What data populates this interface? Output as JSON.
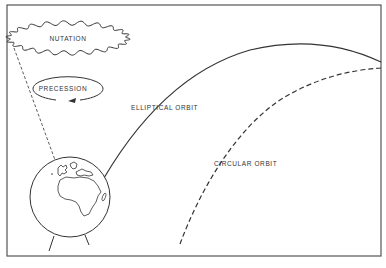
{
  "diagram": {
    "labels": {
      "nutation": "NUTATION",
      "precession": "PRECESSION",
      "elliptical_orbit": "ELLIPTICAL ORBIT",
      "circular_orbit": "CIRCULAR ORBIT"
    },
    "colors": {
      "line": "#3a3a3a",
      "frame": "#555555",
      "background": "#ffffff"
    }
  }
}
